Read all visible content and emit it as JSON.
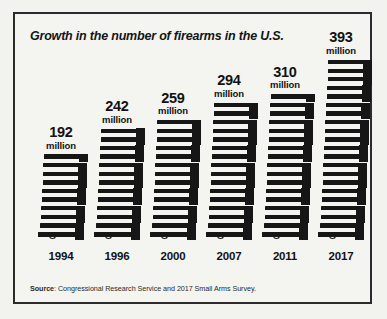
{
  "chart": {
    "title": "Growth in the number of firearms in the U.S.",
    "source_label": "Source",
    "source_text": ": Congressional Research Service and 2017 Small Arms Survey."
  },
  "chart_data": {
    "type": "bar",
    "title": "Growth in the number of firearms in the U.S.",
    "xlabel": "",
    "ylabel": "",
    "unit": "million",
    "categories": [
      "1994",
      "1996",
      "2000",
      "2007",
      "2011",
      "2017"
    ],
    "values": [
      192,
      242,
      259,
      294,
      310,
      393
    ],
    "value_labels": [
      "192",
      "242",
      "259",
      "294",
      "310",
      "393"
    ],
    "unit_labels": [
      "million",
      "million",
      "million",
      "million",
      "million",
      "million"
    ],
    "ylim": [
      0,
      393
    ],
    "grid": false,
    "legend": null,
    "icon": "pistol-icon",
    "icon_counts": [
      10,
      13,
      14,
      16,
      17,
      21
    ],
    "annotations": [
      "Source: Congressional Research Service and 2017 Small Arms Survey."
    ],
    "colors": {
      "bar": "#161616",
      "background": "#f4f4f1",
      "border": "#2b2b2b",
      "text": "#121212"
    }
  }
}
